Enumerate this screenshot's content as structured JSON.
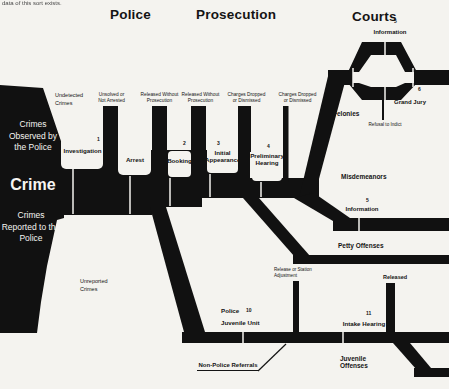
{
  "page": {
    "cutoff_text": "data of this sort exists."
  },
  "colors": {
    "ink": "#111111",
    "paper": "#f4f3ef"
  },
  "headers": {
    "police": "Police",
    "prosecution": "Prosecution",
    "courts": "Courts"
  },
  "funnel": {
    "observed": "Crimes Observed by the Police",
    "crime": "Crime",
    "reported": "Crimes Reported to the Police",
    "undetected": "Undetected Crimes",
    "unreported": "Unreported Crimes"
  },
  "stages": [
    {
      "num": "1",
      "label": "Investigation"
    },
    {
      "num": "",
      "label": "Arrest"
    },
    {
      "num": "2",
      "label": "Booking"
    },
    {
      "num": "3",
      "label": "Initial Appearance"
    },
    {
      "num": "4",
      "label": "Preliminary Hearing"
    }
  ],
  "exits": [
    {
      "label": "Unsolved or Not Arrested"
    },
    {
      "label": "Released Without Prosecution"
    },
    {
      "label": "Released Without Prosecution"
    },
    {
      "label": "Charges Dropped or Dismissed"
    },
    {
      "label": "Charges Dropped or Dismissed"
    }
  ],
  "courts": {
    "information_top_num": "5",
    "information_top": "Information",
    "grand_jury_num": "6",
    "grand_jury": "Grand Jury",
    "refusal_to_indict": "Refusal to Indict",
    "felonies": "Felonies",
    "misdemeanors": "Misdemeanors",
    "information_mid_num": "5",
    "information_mid": "Information",
    "petty_offenses": "Petty Offenses"
  },
  "juvenile": {
    "police_juvenile_unit_num": "10",
    "police_juvenile_unit_line1": "Police",
    "police_juvenile_unit_line2": "Juvenile Unit",
    "release_or_station": "Release or Station Adjustment",
    "non_police_referrals": "Non-Police Referrals",
    "released": "Released",
    "intake_hearing_num": "11",
    "intake_hearing": "Intake Hearing",
    "juvenile_offenses": "Juvenile Offenses"
  }
}
